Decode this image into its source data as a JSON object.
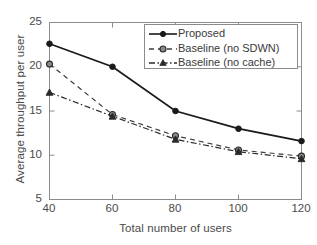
{
  "chart_data": {
    "type": "line",
    "title": "",
    "xlabel": "Total number of users",
    "ylabel": "Average throughput per user",
    "x": [
      40,
      60,
      80,
      100,
      120
    ],
    "xticklabels": [
      "40",
      "60",
      "80",
      "100",
      "120"
    ],
    "yticklabels": [
      "25",
      "20",
      "15",
      "10",
      "5"
    ],
    "yticks": [
      25,
      20,
      15,
      10,
      5
    ],
    "xlim": [
      40,
      120
    ],
    "ylim": [
      5,
      25
    ],
    "grid": false,
    "legend_position": "top-right",
    "series": [
      {
        "name": "Proposed",
        "values": [
          22.6,
          20.0,
          15.0,
          13.0,
          11.6
        ],
        "linestyle": "solid",
        "marker": "filled-circle",
        "color": "#1a1a1a"
      },
      {
        "name": "Baseline (no SDWN)",
        "values": [
          20.3,
          14.6,
          12.2,
          10.6,
          9.9
        ],
        "linestyle": "dashed",
        "marker": "hexagram",
        "color": "#3c3c3c"
      },
      {
        "name": "Baseline (no cache)",
        "values": [
          17.1,
          14.4,
          11.8,
          10.4,
          9.6
        ],
        "linestyle": "dash-dot",
        "marker": "filled-triangle",
        "color": "#2a2a2a"
      }
    ]
  },
  "legend": {
    "items": [
      {
        "label": "Proposed"
      },
      {
        "label": "Baseline (no SDWN)"
      },
      {
        "label": "Baseline (no cache)"
      }
    ]
  },
  "axes": {
    "x_ticks": [
      {
        "label": "40"
      },
      {
        "label": "60"
      },
      {
        "label": "80"
      },
      {
        "label": "100"
      },
      {
        "label": "120"
      }
    ],
    "y_ticks": [
      {
        "label": "25"
      },
      {
        "label": "20"
      },
      {
        "label": "15"
      },
      {
        "label": "10"
      },
      {
        "label": "5"
      }
    ],
    "x_title": "Total number of users",
    "y_title": "Average throughput per user"
  }
}
